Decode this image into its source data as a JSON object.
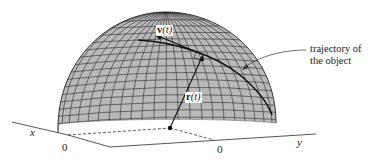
{
  "figure": {
    "labels": {
      "velocity_symbol": "v",
      "velocity_arg": "(t)",
      "position_symbol": "r",
      "position_arg": "(t)",
      "x_axis": "x",
      "y_axis": "y",
      "x_zero": "0",
      "y_zero": "0",
      "annotation_line1": "trajectory of",
      "annotation_line2": "the object"
    },
    "colors": {
      "surface_fill": "#b9b9b9",
      "grid_lines": "#2a2a2a",
      "curve": "#111111",
      "background": "#ffffff"
    }
  }
}
